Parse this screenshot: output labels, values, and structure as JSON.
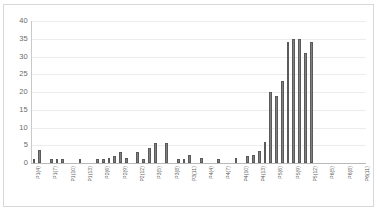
{
  "chart_data": {
    "type": "bar",
    "title": "",
    "subtitle": "",
    "xlabel": "",
    "ylabel": "",
    "ylim": [
      0,
      40
    ],
    "yticks": [
      0,
      5,
      10,
      15,
      20,
      25,
      30,
      35,
      40
    ],
    "grid": true,
    "legend": false,
    "legend_position": "none",
    "bar_color": "#808080",
    "bar_edge_color": "#5a5a5a",
    "categories": [
      "P1(4)",
      "P1(5)",
      "P1(6)",
      "P1(7)",
      "P1(8)",
      "P1(9)",
      "P1(10)",
      "P1(11)",
      "P1(12)",
      "P1(13)",
      "P2(4)",
      "P2(5)",
      "P2(6)",
      "P2(7)",
      "P2(8)",
      "P2(9)",
      "P2(10)",
      "P2(11)",
      "P2(12)",
      "P2(13)",
      "P3(4)",
      "P3(5)",
      "P3(6)",
      "P3(7)",
      "P3(8)",
      "P3(9)",
      "P3(10)",
      "P3(11)",
      "P3(12)",
      "P3(13)",
      "P4(4)",
      "P4(5)",
      "P4(6)",
      "P4(7)",
      "P4(8)",
      "P4(9)",
      "P4(10)",
      "P4(11)",
      "P4(12)",
      "P4(13)",
      "P5(4)",
      "P5(5)",
      "P5(6)",
      "P5(7)",
      "P5(8)",
      "P5(9)",
      "P5(10)",
      "P5(11)",
      "P5(12)",
      "P5(13)",
      "P6(4)",
      "P6(5)",
      "P6(6)",
      "P6(7)",
      "P6(8)",
      "P6(9)",
      "P6(10)",
      "P6(11)"
    ],
    "values": [
      1.2,
      3.6,
      0.0,
      1.1,
      1.1,
      1.1,
      0.0,
      0.0,
      1.1,
      0.0,
      0.0,
      1.1,
      1.2,
      1.4,
      2.0,
      3.2,
      1.3,
      0.0,
      3.0,
      1.0,
      4.2,
      5.6,
      0.0,
      5.7,
      0.0,
      1.0,
      1.2,
      2.2,
      0.0,
      1.4,
      0.0,
      0.0,
      1.0,
      0.0,
      0.0,
      1.3,
      0.0,
      2.0,
      2.2,
      3.4,
      5.8,
      20.0,
      19.0,
      23.0,
      34.0,
      34.8,
      34.8,
      31.0,
      34.0,
      0.0,
      0.0,
      0.0,
      0.0,
      0.0,
      0.0,
      0.0,
      0.0,
      0.0
    ],
    "visible_xtick_labels": [
      "P1(4)",
      "P1(7)",
      "P1(10)",
      "P1(13)",
      "P2(4)",
      "P2(7)",
      "P2(10)",
      "P2(13)",
      "P3(4)",
      "P3(7)",
      "P3(10)",
      "P3(13)",
      "P4(4)",
      "P4(7)",
      "P4(10)",
      "P4(13)",
      "P5(4)",
      "P5(7)",
      "P5(10)",
      "P5(13)"
    ]
  }
}
